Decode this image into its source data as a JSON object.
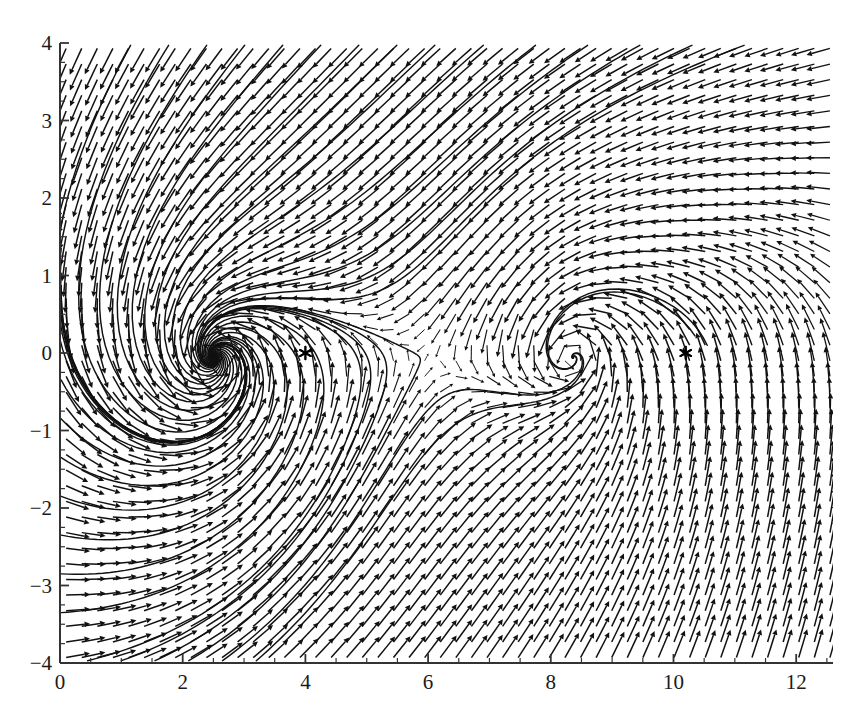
{
  "chart_data": {
    "type": "line",
    "title": "",
    "subtitle": "",
    "xlabel": "",
    "ylabel": "",
    "xlim": [
      0,
      12.6
    ],
    "ylim": [
      -4,
      4
    ],
    "grid": false,
    "legend": "none",
    "x_ticks": [
      {
        "value": 0,
        "label": "0"
      },
      {
        "value": 2,
        "label": "2"
      },
      {
        "value": 4,
        "label": "4"
      },
      {
        "value": 6,
        "label": "6"
      },
      {
        "value": 8,
        "label": "8"
      },
      {
        "value": 10,
        "label": "10"
      },
      {
        "value": 12,
        "label": "12"
      }
    ],
    "y_ticks": [
      {
        "value": 4,
        "label": "4"
      },
      {
        "value": 3,
        "label": "3"
      },
      {
        "value": 2,
        "label": "2"
      },
      {
        "value": 1,
        "label": "1"
      },
      {
        "value": 0,
        "label": "0"
      },
      {
        "value": -1,
        "label": "−1"
      },
      {
        "value": -2,
        "label": "−2"
      },
      {
        "value": -3,
        "label": "−3"
      },
      {
        "value": -4,
        "label": "−4"
      }
    ],
    "x_minor_tick_step": 0.5,
    "y_minor_tick_step": 0.25,
    "markers": [
      {
        "name": "saddle-marker-left",
        "symbol": "asterisk",
        "x": 4.0,
        "y": 0.0
      },
      {
        "name": "saddle-marker-right",
        "symbol": "asterisk",
        "x": 10.2,
        "y": 0.0
      }
    ],
    "equilibria": [
      {
        "name": "spiral-sink",
        "x": 2.4,
        "y": 0.0,
        "type": "stable-spiral"
      },
      {
        "name": "spiral-focus",
        "x": 8.62,
        "y": 0.0,
        "type": "stable-spiral"
      },
      {
        "name": "saddle-a",
        "x": 4.0,
        "y": 0.0,
        "type": "saddle"
      },
      {
        "name": "saddle-b",
        "x": 10.2,
        "y": 0.0,
        "type": "saddle"
      }
    ],
    "quiver": {
      "x_start": 0.1,
      "x_end": 12.55,
      "y_start": -3.93,
      "y_end": 3.93,
      "nx": 50,
      "ny": 40,
      "arrow_color": "#111111"
    },
    "series": [
      {
        "name": "trajectory-1",
        "stroke": "#111111"
      },
      {
        "name": "trajectory-2",
        "stroke": "#111111"
      },
      {
        "name": "trajectory-3",
        "stroke": "#111111"
      },
      {
        "name": "trajectory-4",
        "stroke": "#111111"
      },
      {
        "name": "trajectory-5",
        "stroke": "#111111"
      },
      {
        "name": "trajectory-6",
        "stroke": "#111111"
      },
      {
        "name": "trajectory-7",
        "stroke": "#111111"
      },
      {
        "name": "trajectory-8",
        "stroke": "#111111"
      },
      {
        "name": "trajectory-9",
        "stroke": "#111111"
      },
      {
        "name": "trajectory-10",
        "stroke": "#111111"
      }
    ]
  },
  "axes": {
    "frame_color": "#333333",
    "background": "#ffffff",
    "plot_left_px": 60,
    "plot_right_px": 833,
    "plot_top_px": 43,
    "plot_bottom_px": 663
  }
}
